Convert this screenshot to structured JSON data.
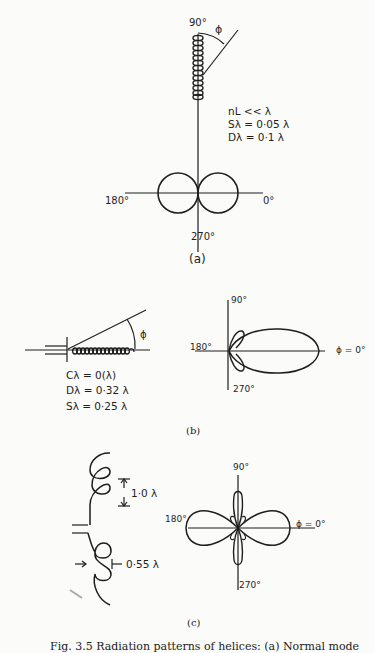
{
  "figure": {
    "caption": "Fig. 3.5  Radiation patterns of helices: (a) Normal mode",
    "panels": [
      {
        "id": "a",
        "label": "(a)",
        "mode": "normal",
        "angles": {
          "top": "90°",
          "left": "180°",
          "right": "0°",
          "bottom": "270°"
        },
        "angle_symbol": "ϕ",
        "params": [
          "nL << λ",
          "Sλ = 0·05 λ",
          "Dλ = 0·1 λ"
        ],
        "pattern_shape": "figure-eight (two circular lobes along 0°/180° axis)"
      },
      {
        "id": "b",
        "label": "(b)",
        "mode": "axial",
        "angles": {
          "top": "90°",
          "left": "180°",
          "right": "ϕ = 0°",
          "bottom": "270°"
        },
        "angle_symbol": "ϕ",
        "params": [
          "Cλ = 0(λ)",
          "Dλ = 0·32 λ",
          "Sλ = 0·25 λ"
        ],
        "pattern_shape": "single main lobe toward 0° with small back lobes"
      },
      {
        "id": "c",
        "label": "(c)",
        "mode": "conical",
        "angles": {
          "top": "90°",
          "left": "180°",
          "right": "ϕ = 0°",
          "bottom": "270°"
        },
        "dimensions": [
          "1·0 λ",
          "0·55 λ"
        ],
        "pattern_shape": "four-lobed pattern (two broad horizontal, two narrow vertical lobes)"
      }
    ]
  }
}
